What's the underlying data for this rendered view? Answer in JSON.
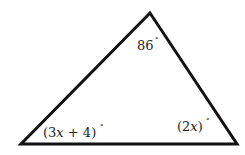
{
  "diagram": {
    "type": "triangle",
    "stroke_color": "#111111",
    "background": "#ffffff",
    "vertices": {
      "top": [
        150,
        13
      ],
      "bottom_left": [
        21,
        144
      ],
      "bottom_right": [
        237,
        144
      ]
    },
    "angles": {
      "top": {
        "text": "86",
        "degree": "°"
      },
      "bottom_left": {
        "open": "(",
        "coef": "3",
        "var": "x",
        "rest": " + 4)",
        "degree": "°"
      },
      "bottom_right": {
        "open": "(2",
        "var": "x",
        "close": ")",
        "degree": "°"
      }
    }
  }
}
